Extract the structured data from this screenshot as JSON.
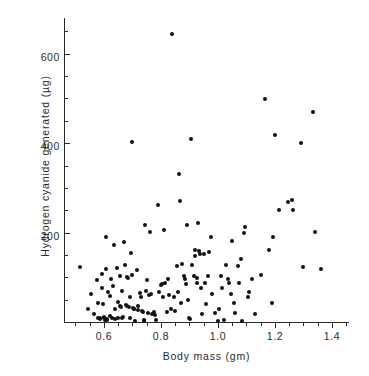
{
  "chart_data": {
    "type": "scatter",
    "title": "",
    "xlabel": "Body mass (gm)",
    "ylabel": "Hydrogen cyanide generated (µg)",
    "xlim": [
      0.46,
      1.46
    ],
    "ylim": [
      0,
      680
    ],
    "grid": false,
    "legend": null,
    "xticks": [
      0.6,
      0.8,
      1.0,
      1.2,
      1.4
    ],
    "xticklabels": [
      "0.6",
      "0.8",
      "1.0",
      "1.2",
      "1.4"
    ],
    "yticks": [
      200,
      400,
      600
    ],
    "yticklabels": [
      "200",
      "400",
      "600"
    ],
    "x_minor_tick_step": 0.05,
    "y_minor_tick_step": 50,
    "marker": "filled-circle",
    "marker_color": "#111111",
    "points": [
      [
        0.515,
        122
      ],
      [
        0.545,
        30
      ],
      [
        0.555,
        62
      ],
      [
        0.565,
        18
      ],
      [
        0.575,
        95
      ],
      [
        0.578,
        43
      ],
      [
        0.58,
        8
      ],
      [
        0.585,
        10
      ],
      [
        0.588,
        6
      ],
      [
        0.592,
        108
      ],
      [
        0.595,
        76
      ],
      [
        0.598,
        40
      ],
      [
        0.6,
        12
      ],
      [
        0.602,
        9
      ],
      [
        0.605,
        5
      ],
      [
        0.606,
        118
      ],
      [
        0.608,
        190
      ],
      [
        0.61,
        7
      ],
      [
        0.612,
        4
      ],
      [
        0.615,
        66
      ],
      [
        0.62,
        58
      ],
      [
        0.622,
        14
      ],
      [
        0.625,
        96
      ],
      [
        0.63,
        10
      ],
      [
        0.632,
        80
      ],
      [
        0.635,
        172
      ],
      [
        0.638,
        30
      ],
      [
        0.64,
        6
      ],
      [
        0.645,
        120
      ],
      [
        0.648,
        44
      ],
      [
        0.65,
        8
      ],
      [
        0.655,
        103
      ],
      [
        0.658,
        36
      ],
      [
        0.66,
        34
      ],
      [
        0.662,
        10
      ],
      [
        0.665,
        70
      ],
      [
        0.668,
        12
      ],
      [
        0.672,
        180
      ],
      [
        0.675,
        128
      ],
      [
        0.678,
        38
      ],
      [
        0.68,
        36
      ],
      [
        0.682,
        100
      ],
      [
        0.685,
        98
      ],
      [
        0.688,
        34
      ],
      [
        0.69,
        56
      ],
      [
        0.692,
        10
      ],
      [
        0.695,
        155
      ],
      [
        0.698,
        106
      ],
      [
        0.7,
        402
      ],
      [
        0.702,
        32
      ],
      [
        0.705,
        30
      ],
      [
        0.706,
        28
      ],
      [
        0.71,
        2
      ],
      [
        0.715,
        116
      ],
      [
        0.718,
        36
      ],
      [
        0.72,
        26
      ],
      [
        0.725,
        64
      ],
      [
        0.73,
        56
      ],
      [
        0.735,
        24
      ],
      [
        0.738,
        22
      ],
      [
        0.74,
        2
      ],
      [
        0.742,
        4
      ],
      [
        0.745,
        218
      ],
      [
        0.748,
        70
      ],
      [
        0.75,
        94
      ],
      [
        0.755,
        20
      ],
      [
        0.758,
        60
      ],
      [
        0.76,
        202
      ],
      [
        0.765,
        62
      ],
      [
        0.77,
        18
      ],
      [
        0.775,
        22
      ],
      [
        0.78,
        16
      ],
      [
        0.782,
        4
      ],
      [
        0.79,
        262
      ],
      [
        0.795,
        66
      ],
      [
        0.8,
        82
      ],
      [
        0.805,
        84
      ],
      [
        0.808,
        56
      ],
      [
        0.812,
        206
      ],
      [
        0.815,
        88
      ],
      [
        0.82,
        22
      ],
      [
        0.825,
        96
      ],
      [
        0.83,
        60
      ],
      [
        0.835,
        28
      ],
      [
        0.84,
        645
      ],
      [
        0.845,
        56
      ],
      [
        0.85,
        24
      ],
      [
        0.855,
        126
      ],
      [
        0.86,
        68
      ],
      [
        0.865,
        330
      ],
      [
        0.868,
        270
      ],
      [
        0.872,
        42
      ],
      [
        0.875,
        130
      ],
      [
        0.88,
        104
      ],
      [
        0.885,
        96
      ],
      [
        0.888,
        86
      ],
      [
        0.89,
        216
      ],
      [
        0.895,
        50
      ],
      [
        0.9,
        8
      ],
      [
        0.902,
        6
      ],
      [
        0.905,
        410
      ],
      [
        0.91,
        128
      ],
      [
        0.915,
        102
      ],
      [
        0.918,
        162
      ],
      [
        0.92,
        148
      ],
      [
        0.925,
        98
      ],
      [
        0.928,
        88
      ],
      [
        0.93,
        222
      ],
      [
        0.935,
        158
      ],
      [
        0.938,
        152
      ],
      [
        0.94,
        76
      ],
      [
        0.945,
        18
      ],
      [
        0.95,
        152
      ],
      [
        0.955,
        88
      ],
      [
        0.958,
        40
      ],
      [
        0.965,
        104
      ],
      [
        0.97,
        156
      ],
      [
        0.975,
        190
      ],
      [
        0.98,
        62
      ],
      [
        0.99,
        20
      ],
      [
        1.0,
        2
      ],
      [
        1.005,
        30
      ],
      [
        1.01,
        102
      ],
      [
        1.015,
        76
      ],
      [
        1.02,
        4
      ],
      [
        1.03,
        128
      ],
      [
        1.035,
        96
      ],
      [
        1.04,
        88
      ],
      [
        1.045,
        62
      ],
      [
        1.05,
        182
      ],
      [
        1.055,
        42
      ],
      [
        1.06,
        20
      ],
      [
        1.07,
        126
      ],
      [
        1.075,
        88
      ],
      [
        1.08,
        140
      ],
      [
        1.085,
        2
      ],
      [
        1.09,
        200
      ],
      [
        1.095,
        212
      ],
      [
        1.105,
        56
      ],
      [
        1.11,
        68
      ],
      [
        1.12,
        96
      ],
      [
        1.13,
        18
      ],
      [
        1.15,
        106
      ],
      [
        1.165,
        498
      ],
      [
        1.18,
        160
      ],
      [
        1.19,
        42
      ],
      [
        1.195,
        190
      ],
      [
        1.2,
        418
      ],
      [
        1.215,
        250
      ],
      [
        1.245,
        268
      ],
      [
        1.26,
        272
      ],
      [
        1.265,
        250
      ],
      [
        1.29,
        400
      ],
      [
        1.3,
        124
      ],
      [
        1.335,
        470
      ],
      [
        1.34,
        202
      ],
      [
        1.36,
        118
      ]
    ]
  }
}
